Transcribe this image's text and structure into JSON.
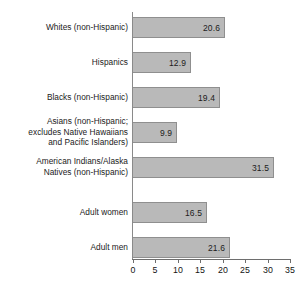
{
  "chart_data": {
    "type": "bar",
    "orientation": "horizontal",
    "title": "",
    "subtitle": "",
    "xlabel": "",
    "ylabel": "",
    "xlim": [
      0,
      35
    ],
    "xticks": [
      "0",
      "5",
      "10",
      "15",
      "20",
      "25",
      "30",
      "35"
    ],
    "grid": false,
    "legend": null,
    "categories": [
      "Whites (non-Hispanic)",
      "Hispanics",
      "Blacks (non-Hispanic)",
      "Asians (non-Hispanic;\nexcludes Native Hawaiians\nand Pacific Islanders)",
      "American Indians/Alaska\nNatives (non-Hispanic)",
      "Adult women",
      "Adult men"
    ],
    "values": [
      20.6,
      12.9,
      19.4,
      9.9,
      31.5,
      16.5,
      21.6
    ],
    "value_labels": [
      "20.6",
      "12.9",
      "19.4",
      "9.9",
      "31.5",
      "16.5",
      "21.6"
    ],
    "bar_color": "#b9b9b9",
    "bar_border_color": "#8f8f8f",
    "axis_color": "#6e6e6e",
    "text_color": "#1a1a1a",
    "group_break_after_index": 4
  },
  "bars": [
    {
      "label": "Whites (non-Hispanic)",
      "value": 20.6,
      "value_label": "20.6"
    },
    {
      "label": "Hispanics",
      "value": 12.9,
      "value_label": "12.9"
    },
    {
      "label": "Blacks (non-Hispanic)",
      "value": 19.4,
      "value_label": "19.4"
    },
    {
      "label": "Asians (non-Hispanic;\nexcludes Native Hawaiians\nand Pacific Islanders)",
      "value": 9.9,
      "value_label": "9.9"
    },
    {
      "label": "American Indians/Alaska\nNatives (non-Hispanic)",
      "value": 31.5,
      "value_label": "31.5"
    },
    {
      "label": "Adult women",
      "value": 16.5,
      "value_label": "16.5"
    },
    {
      "label": "Adult men",
      "value": 21.6,
      "value_label": "21.6"
    }
  ],
  "axis": {
    "ticks": [
      "0",
      "5",
      "10",
      "15",
      "20",
      "25",
      "30",
      "35"
    ]
  }
}
